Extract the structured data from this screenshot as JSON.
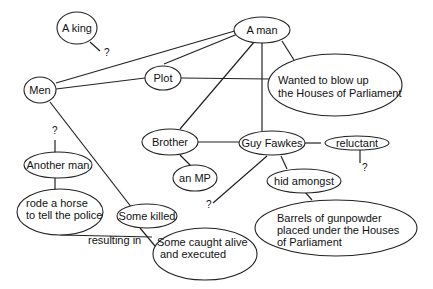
{
  "diagram": {
    "nodes": {
      "a_king": {
        "label": "A king"
      },
      "a_man": {
        "label": "A man"
      },
      "men": {
        "label": "Men"
      },
      "plot": {
        "label": "Plot"
      },
      "wanted_line1": {
        "label": "Wanted to blow up"
      },
      "wanted_line2": {
        "label": "the Houses of Parliament"
      },
      "brother": {
        "label": "Brother"
      },
      "guy_fawkes": {
        "label": "Guy Fawkes"
      },
      "reluctant": {
        "label": "reluctant"
      },
      "an_mp": {
        "label": "an MP"
      },
      "hid_amongst": {
        "label": "hid amongst"
      },
      "another_man": {
        "label": "Another man"
      },
      "rode_line1": {
        "label": "rode a horse"
      },
      "rode_line2": {
        "label": "to tell the police"
      },
      "some_killed": {
        "label": "Some killed"
      },
      "caught_line1": {
        "label": "Some caught alive"
      },
      "caught_line2": {
        "label": "and executed"
      },
      "barrels_line1": {
        "label": "Barrels of gunpowder"
      },
      "barrels_line2": {
        "label": "placed under the Houses"
      },
      "barrels_line3": {
        "label": "of Parliament"
      }
    },
    "edge_labels": {
      "resulting_in": "resulting in"
    },
    "question_marks": {
      "king_q": "?",
      "men_q": "?",
      "fawkes_q": "?",
      "reluctant_q": "?"
    }
  }
}
